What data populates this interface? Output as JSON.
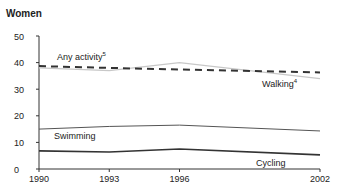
{
  "title": "Women",
  "chart_data": {
    "type": "line",
    "title": "Women",
    "xlabel": "",
    "ylabel": "",
    "x": [
      1990,
      1993,
      1996,
      2002
    ],
    "x_ticks": [
      "1990",
      "1993",
      "1996",
      "2002"
    ],
    "y_ticks": [
      "0",
      "10",
      "20",
      "30",
      "40",
      "50"
    ],
    "ylim": [
      0,
      50
    ],
    "grid": false,
    "legend": "inline labels",
    "series": [
      {
        "name": "Any activity",
        "footnote": "5",
        "style": "dashed",
        "color": "#333333",
        "values": [
          38.7,
          38.0,
          37.4,
          36.3
        ]
      },
      {
        "name": "Walking",
        "footnote": "4",
        "style": "solid-light",
        "color": "#c8c8c8",
        "values": [
          38.0,
          37.0,
          40.0,
          34.0
        ]
      },
      {
        "name": "Swimming",
        "style": "solid-thin",
        "color": "#555555",
        "values": [
          15.0,
          16.0,
          16.5,
          14.3
        ]
      },
      {
        "name": "Cycling",
        "style": "solid",
        "color": "#333333",
        "values": [
          6.8,
          6.4,
          7.5,
          5.3
        ]
      }
    ]
  },
  "labels": {
    "any_activity": "Any activity",
    "any_activity_sup": "5",
    "walking": "Walking",
    "walking_sup": "4",
    "swimming": "Swimming",
    "cycling": "Cycling"
  }
}
